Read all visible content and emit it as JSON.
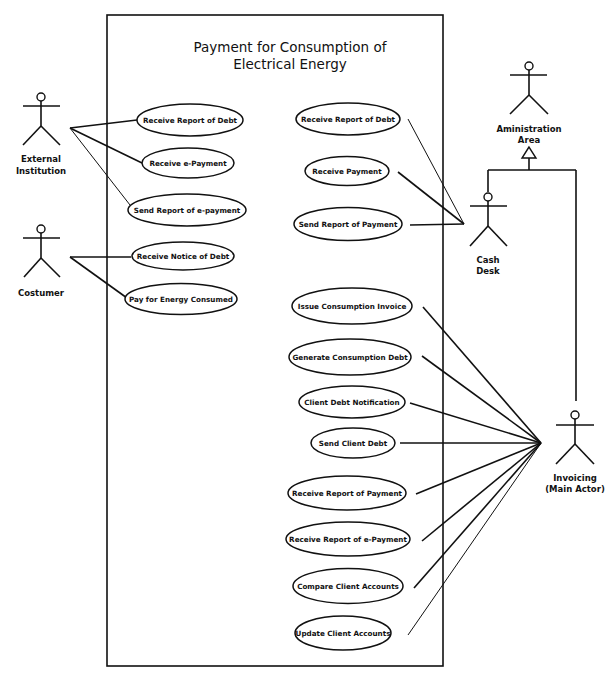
{
  "diagram": {
    "type": "UML use case diagram",
    "system": {
      "title_line1": "Payment for Consumption of",
      "title_line2": "Electrical Energy"
    },
    "actors": [
      {
        "id": "external_institution",
        "label_line1": "External",
        "label_line2": "Institution"
      },
      {
        "id": "costumer",
        "label_line1": "Costumer",
        "label_line2": ""
      },
      {
        "id": "administration_area",
        "label_line1": "Aministration",
        "label_line2": "Area"
      },
      {
        "id": "cash_desk",
        "label_line1": "Cash",
        "label_line2": "Desk"
      },
      {
        "id": "invoicing",
        "label_line1": "Invoicing",
        "label_line2": "(Main Actor)"
      }
    ],
    "use_cases": [
      {
        "id": "uc1",
        "label": "Receive Report of Debt",
        "actor": "external_institution"
      },
      {
        "id": "uc2",
        "label": "Receive e-Payment",
        "actor": "external_institution"
      },
      {
        "id": "uc3",
        "label": "Send Report of e-payment",
        "actor": "external_institution"
      },
      {
        "id": "uc4",
        "label": "Receive Notice of Debt",
        "actor": "costumer"
      },
      {
        "id": "uc5",
        "label": "Pay for Energy Consumed",
        "actor": "costumer"
      },
      {
        "id": "uc6",
        "label": "Receive Report of Debt",
        "actor": "cash_desk"
      },
      {
        "id": "uc7",
        "label": "Receive Payment",
        "actor": "cash_desk"
      },
      {
        "id": "uc8",
        "label": "Send Report of Payment",
        "actor": "cash_desk"
      },
      {
        "id": "uc9",
        "label": "Issue Consumption Invoice",
        "actor": "invoicing"
      },
      {
        "id": "uc10",
        "label": "Generate Consumption Debt",
        "actor": "invoicing"
      },
      {
        "id": "uc11",
        "label": "Client Debt Notification",
        "actor": "invoicing"
      },
      {
        "id": "uc12",
        "label": "Send Client Debt",
        "actor": "invoicing"
      },
      {
        "id": "uc13",
        "label": "Receive Report of Payment",
        "actor": "invoicing"
      },
      {
        "id": "uc14",
        "label": "Receive Report of e-Payment",
        "actor": "invoicing"
      },
      {
        "id": "uc15",
        "label": "Compare Client Accounts",
        "actor": "invoicing"
      },
      {
        "id": "uc16",
        "label": "Update Client Accounts",
        "actor": "invoicing"
      }
    ],
    "generalizations": [
      {
        "child": "cash_desk",
        "parent": "administration_area"
      },
      {
        "child": "invoicing",
        "parent": "administration_area"
      }
    ]
  }
}
